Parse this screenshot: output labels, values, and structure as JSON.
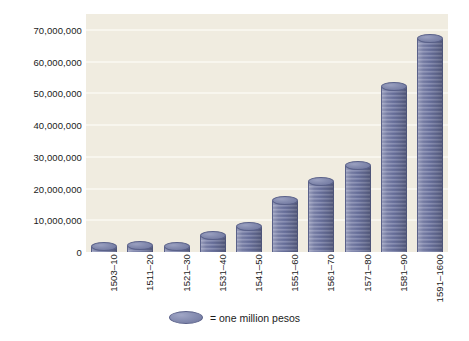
{
  "chart_data": {
    "type": "bar",
    "title": "",
    "subtitle": "",
    "xlabel": "",
    "ylabel": "",
    "grid": true,
    "legend_position": "bottom",
    "ylim": [
      0,
      75000000
    ],
    "y_ticks": [
      0,
      10000000,
      20000000,
      30000000,
      40000000,
      50000000,
      60000000,
      70000000
    ],
    "y_tick_labels": [
      "0",
      "10,000,000",
      "20,000,000",
      "30,000,000",
      "40,000,000",
      "50,000,000",
      "60,000,000",
      "70,000,000"
    ],
    "categories": [
      "1503–10",
      "1511–20",
      "1521–30",
      "1531–40",
      "1541–50",
      "1551–60",
      "1561–70",
      "1571–80",
      "1581–90",
      "1591–1600"
    ],
    "values": [
      1500000,
      2000000,
      1500000,
      5000000,
      8000000,
      16000000,
      22000000,
      27000000,
      52000000,
      67000000
    ],
    "unit": "pesos",
    "legend": [
      {
        "symbol": "coin-disc",
        "label": "= one million pesos"
      }
    ],
    "colors": {
      "bar": "#787fa8",
      "bar_dark": "#5e6691",
      "plot_background": "#f0ece0",
      "gridline": "#f8f6ee",
      "page_background": "#ffffff",
      "text": "#1b1b1b"
    }
  }
}
